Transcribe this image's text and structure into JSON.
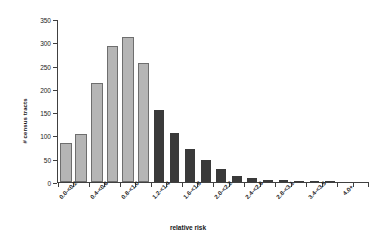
{
  "chart_data": {
    "type": "bar",
    "title": "",
    "xlabel": "relative risk",
    "ylabel": "# census tracts",
    "ylim": [
      0,
      350
    ],
    "ytick_step": 50,
    "yticks": [
      0,
      50,
      100,
      150,
      200,
      250,
      300,
      350
    ],
    "grid": false,
    "legend": "none",
    "bar_colors": {
      "low": "#b5b5b5",
      "high": "#3a3a3a",
      "edge": "#6e6e6e"
    },
    "categories": [
      "0.0-<0.2",
      "0.2-<0.4",
      "0.4-<0.6",
      "0.6-<0.8",
      "0.8-<1.0",
      "1.0-<1.2",
      "1.2-<1.4",
      "1.4-<1.6",
      "1.6-<1.8",
      "1.8-<2.0",
      "2.0-<2.2",
      "2.2-<2.4",
      "2.4-<2.6",
      "2.6-<2.8",
      "2.8-<3.1",
      "3.0-<3.2",
      "3.2-<3.4",
      "3.4-<3.5",
      "3.6-<3.8",
      "4.0+"
    ],
    "tick_labels": [
      "0.0-<0.2",
      "",
      "0.4-<0.6",
      "",
      "0.8-<1.0",
      "",
      "1.2-<1.4",
      "",
      "1.6-<1.8",
      "",
      "2.0-<2.2",
      "",
      "2.4-<2.6",
      "",
      "2.8-<3.1",
      "",
      "3.4-<3.5",
      "",
      "4.0+",
      ""
    ],
    "values": [
      80,
      100,
      210,
      290,
      310,
      253,
      155,
      106,
      72,
      48,
      28,
      13,
      8,
      5,
      4,
      3,
      1,
      1,
      0,
      0
    ],
    "shading": [
      "low",
      "low",
      "low",
      "low",
      "low",
      "low",
      "high",
      "high",
      "high",
      "high",
      "high",
      "high",
      "high",
      "high",
      "high",
      "high",
      "high",
      "high",
      "high",
      "high"
    ]
  }
}
